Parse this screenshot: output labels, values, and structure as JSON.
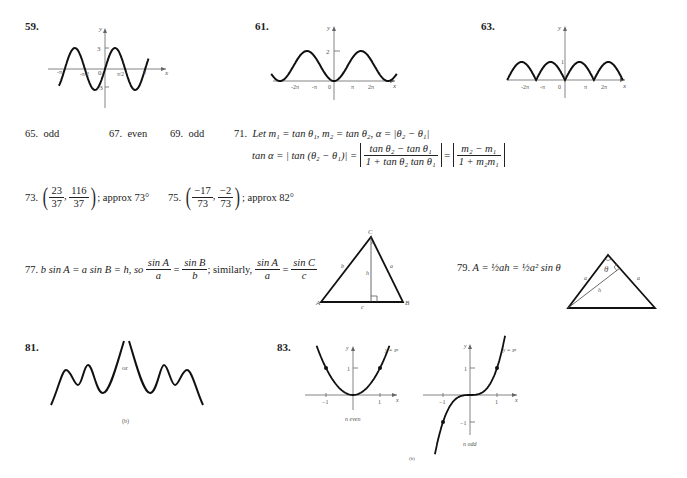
{
  "problems": {
    "p59": {
      "number": "59.",
      "y_label": "y",
      "x_label": "x",
      "ticks": {
        "y_top": "3",
        "y_bottom": "-3",
        "origin": "0",
        "neg_pi": "-π",
        "neg_half_pi": "-π/2",
        "half_pi": "π/2",
        "pi": "π"
      }
    },
    "p61": {
      "number": "61.",
      "y_label": "y",
      "x_label": "x",
      "ticks": {
        "y_top": "2",
        "neg_2pi": "-2π",
        "neg_pi": "-π",
        "origin": "0",
        "pi": "π",
        "two_pi": "2π"
      }
    },
    "p63": {
      "number": "63.",
      "y_label": "y",
      "x_label": "x",
      "ticks": {
        "y_top": "1",
        "neg_2pi": "-2π",
        "neg_pi": "-π",
        "origin": "0",
        "pi": "π",
        "two_pi": "2π"
      }
    },
    "p65": {
      "number": "65.",
      "answer": "odd"
    },
    "p67": {
      "number": "67.",
      "answer": "even"
    },
    "p69": {
      "number": "69.",
      "answer": "odd"
    },
    "p71": {
      "number": "71.",
      "line1": "Let m₁ = tan θ₁, m₂ = tan θ₂, α = |θ₂ − θ₁|",
      "line2_lhs": "tan α = | tan (θ₂ − θ₁)| =",
      "frac1_num": "tan θ₂ − tan θ₁",
      "frac1_den": "1 + tan θ₂ tan θ₁",
      "equals": "=",
      "frac2_num": "m₂ − m₁",
      "frac2_den": "1 + m₂m₁"
    },
    "p73": {
      "number": "73.",
      "x_num": "23",
      "x_den": "37",
      "y_num": "116",
      "y_den": "37",
      "suffix": "; approx 73°"
    },
    "p75": {
      "number": "75.",
      "x_num": "−17",
      "x_den": "73",
      "y_num": "−2",
      "y_den": "73",
      "suffix": "; approx 82°"
    },
    "p77": {
      "number": "77.",
      "text1": "b sin A = a sin B = h, so",
      "f1_num": "sin A",
      "f1_den": "a",
      "eq": "=",
      "f2_num": "sin B",
      "f2_den": "b",
      "similarly": "; similarly,",
      "f3_num": "sin A",
      "f3_den": "a",
      "f4_num": "sin C",
      "f4_den": "c",
      "triangle_labels": {
        "A": "A",
        "B": "B",
        "C": "C",
        "a": "a",
        "b": "b",
        "c": "c",
        "h": "h"
      }
    },
    "p79": {
      "number": "79.",
      "formula": "A = ½ah = ½a² sin θ",
      "triangle_labels": {
        "theta": "θ",
        "a_left": "a",
        "a_right": "a",
        "h": "h"
      }
    },
    "p81": {
      "number": "81.",
      "or_label": "or",
      "caption": "(b)"
    },
    "p83": {
      "number": "83.",
      "curve_label": "y = xⁿ",
      "even": {
        "caption": "n even",
        "y_label": "y",
        "x_label": "x",
        "tick_y1": "1",
        "tick_xm1": "−1",
        "tick_x1": "1"
      },
      "odd": {
        "caption": "n odd",
        "y_label": "y",
        "x_label": "x",
        "tick_y1": "1",
        "tick_ym1": "−1",
        "tick_xm1": "−1",
        "tick_x1": "1"
      },
      "caption": "(b)"
    }
  }
}
